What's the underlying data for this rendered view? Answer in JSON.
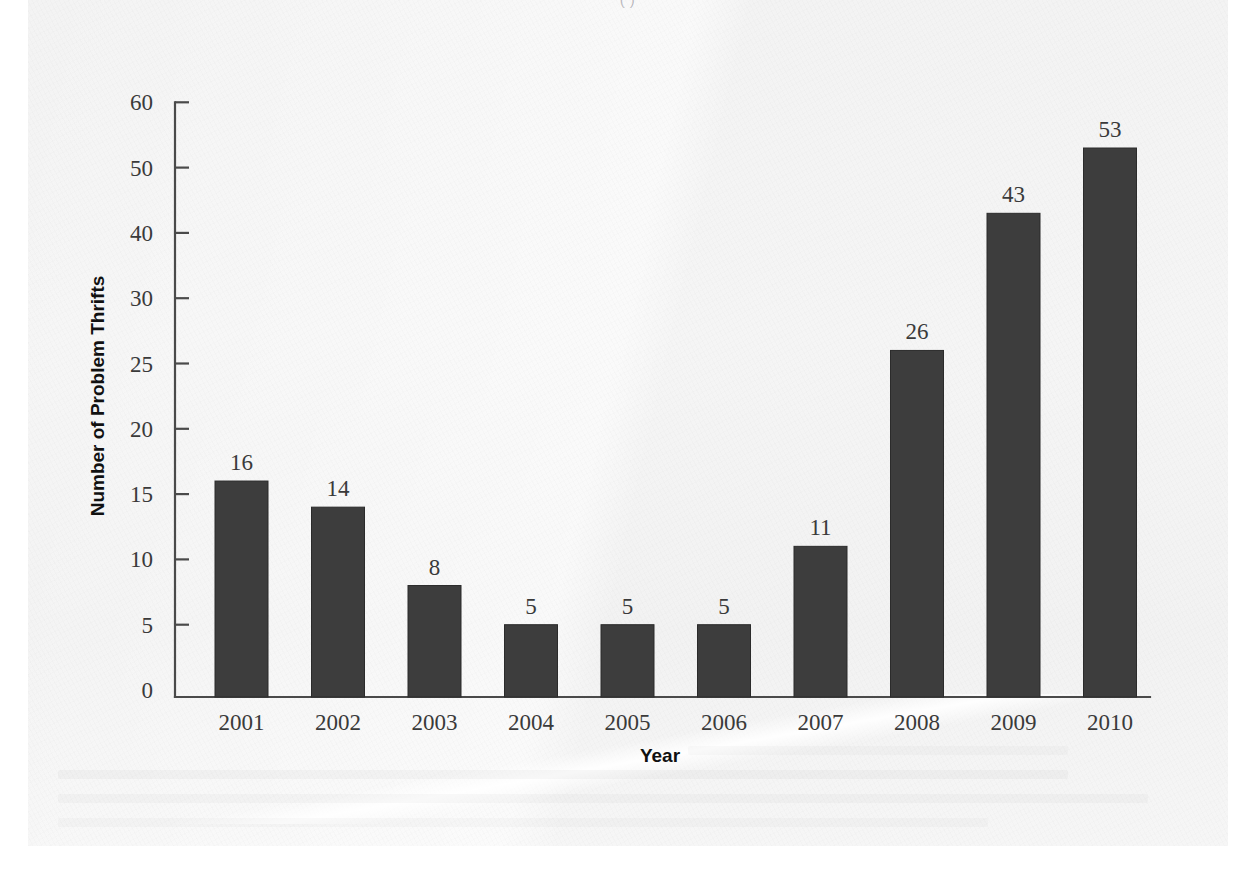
{
  "page": {
    "top_ghost_text": "(                    )",
    "background_color": "#f4f4f4",
    "sheet_color": "#f5f5f5"
  },
  "chart_data": {
    "type": "bar",
    "title": "",
    "xlabel": "Year",
    "ylabel": "Number of Problem Thrifts",
    "categories": [
      "2001",
      "2002",
      "2003",
      "2004",
      "2005",
      "2006",
      "2007",
      "2008",
      "2009",
      "2010"
    ],
    "values": [
      16,
      14,
      8,
      5,
      5,
      5,
      11,
      26,
      43,
      53
    ],
    "value_labels": [
      "16",
      "14",
      "8",
      "5",
      "5",
      "5",
      "11",
      "26",
      "43",
      "53"
    ],
    "ytick_labels": [
      "0",
      "5",
      "10",
      "15",
      "20",
      "25",
      "30",
      "40",
      "50",
      "60"
    ],
    "ytick_values": [
      0,
      5,
      10,
      15,
      20,
      25,
      30,
      40,
      50,
      60
    ],
    "ylim": [
      0,
      60
    ],
    "axis_scale": "non-linear (uniform spacing between listed ticks)",
    "grid": false,
    "legend": false,
    "bar_color": "#3d3d3d",
    "axis_color": "#4a4a4a",
    "text_color": "#3a3a3a"
  }
}
